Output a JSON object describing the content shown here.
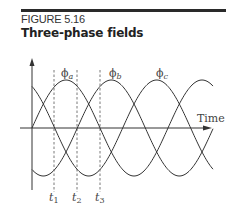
{
  "figure": {
    "number_label": "FIGURE 5.16",
    "title": "Three-phase fields"
  },
  "diagram": {
    "x_axis_label": "Time",
    "curve_labels": [
      {
        "name": "phi_a",
        "symbol": "ϕ",
        "subscript": "a"
      },
      {
        "name": "phi_b",
        "symbol": "ϕ",
        "subscript": "b"
      },
      {
        "name": "phi_c",
        "symbol": "ϕ",
        "subscript": "c"
      }
    ],
    "time_markers": [
      {
        "symbol": "t",
        "subscript": "1"
      },
      {
        "symbol": "t",
        "subscript": "2"
      },
      {
        "symbol": "t",
        "subscript": "3"
      }
    ]
  },
  "chart_data": {
    "type": "line",
    "title": "Three-phase fields",
    "xlabel": "Time",
    "ylabel": "",
    "series": [
      {
        "name": "ϕa",
        "function": "sin(ωt)"
      },
      {
        "name": "ϕb",
        "function": "sin(ωt - 120°)"
      },
      {
        "name": "ϕc",
        "function": "sin(ωt - 240°)"
      }
    ],
    "markers": [
      "t1",
      "t2",
      "t3"
    ],
    "grid": false
  }
}
